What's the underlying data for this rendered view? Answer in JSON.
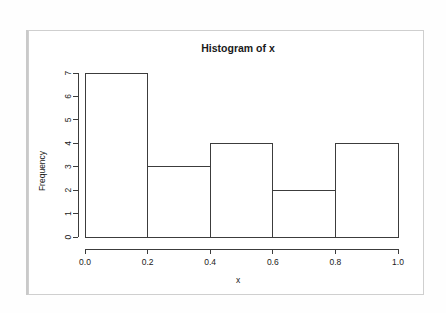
{
  "chart_data": {
    "type": "bar",
    "title": "Histogram of x",
    "xlabel": "x",
    "ylabel": "Frequency",
    "categories": [
      "0.0-0.2",
      "0.2-0.4",
      "0.4-0.6",
      "0.6-0.8",
      "0.8-1.0"
    ],
    "bin_edges": [
      0.0,
      0.2,
      0.4,
      0.6,
      0.8,
      1.0
    ],
    "values": [
      7,
      3,
      4,
      2,
      4
    ],
    "xlim": [
      0.0,
      1.0
    ],
    "ylim": [
      0,
      7
    ],
    "x_ticks": [
      0.0,
      0.2,
      0.4,
      0.6,
      0.8,
      1.0
    ],
    "x_tick_labels": [
      "0.0",
      "0.2",
      "0.4",
      "0.6",
      "0.8",
      "1.0"
    ],
    "y_ticks": [
      0,
      1,
      2,
      3,
      4,
      5,
      6,
      7
    ],
    "y_tick_labels": [
      "0",
      "1",
      "2",
      "3",
      "4",
      "5",
      "6",
      "7"
    ],
    "grid": false,
    "legend": false,
    "bar_fill": "none",
    "bar_stroke": "#3c3c3c",
    "text_color": "#1a1a1a",
    "panel_background": "#ffffff",
    "panel_border": "#cfcfcf"
  }
}
